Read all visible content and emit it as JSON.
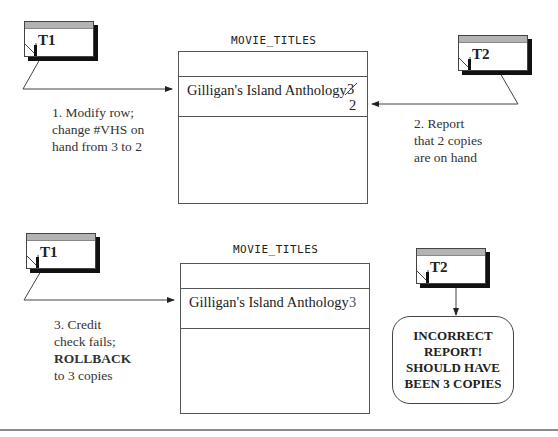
{
  "scene1": {
    "t1_label": "T1",
    "t2_label": "T2",
    "table_title": "MOVIE_TITLES",
    "row_title": "Gilligan's Island Anthology",
    "old_value": "3",
    "new_value": "2",
    "step1_caption": [
      "1. Modify row;",
      "change #VHS on",
      "hand from 3 to 2"
    ],
    "step2_caption": [
      "2. Report",
      "that 2 copies",
      "are on hand"
    ]
  },
  "scene2": {
    "t1_label": "T1",
    "t2_label": "T2",
    "table_title": "MOVIE_TITLES",
    "row_title": "Gilligan's Island Anthology",
    "value": "3",
    "step3_caption": [
      "3. Credit",
      "check fails;",
      "ROLLBACK",
      "to 3 copies"
    ],
    "report_text": [
      "INCORRECT",
      "REPORT!",
      "SHOULD HAVE",
      "BEEN 3 COPIES"
    ]
  }
}
